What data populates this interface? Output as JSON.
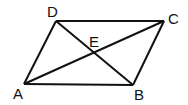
{
  "diagram": {
    "type": "parallelogram-with-diagonals",
    "points": {
      "A": {
        "label": "A",
        "x": 24,
        "y": 84,
        "lx": 13,
        "ly": 99
      },
      "B": {
        "label": "B",
        "x": 133,
        "y": 85,
        "lx": 134,
        "ly": 100
      },
      "C": {
        "label": "C",
        "x": 164,
        "y": 21,
        "lx": 168,
        "ly": 24
      },
      "D": {
        "label": "D",
        "x": 56,
        "y": 21,
        "lx": 47,
        "ly": 17
      },
      "E": {
        "label": "E",
        "x": 95,
        "y": 53,
        "lx": 89,
        "ly": 47
      }
    },
    "edges": [
      [
        "A",
        "B"
      ],
      [
        "B",
        "C"
      ],
      [
        "C",
        "D"
      ],
      [
        "D",
        "A"
      ],
      [
        "A",
        "C"
      ],
      [
        "D",
        "B"
      ]
    ],
    "stroke_color": "#111111"
  }
}
